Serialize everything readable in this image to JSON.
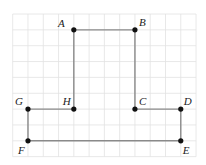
{
  "diagram": {
    "type": "grid-polygon",
    "grid": {
      "columns": 12,
      "rows": 9,
      "origin_px": [
        12.7,
        14
      ],
      "cell_px": [
        15.28,
        15.85
      ],
      "line_color": "#e2e2e2"
    },
    "colors": {
      "segment": "#8a8a8a",
      "point": "#111111",
      "label": "#222222",
      "background": "#ffffff"
    },
    "points": [
      {
        "name": "A",
        "col": 4,
        "row": 1,
        "label_dx": -9,
        "label_dy": -3,
        "anchor": "end"
      },
      {
        "name": "B",
        "col": 8,
        "row": 1,
        "label_dx": 4,
        "label_dy": -4,
        "anchor": "start"
      },
      {
        "name": "C",
        "col": 8,
        "row": 6,
        "label_dx": 4,
        "label_dy": -4,
        "anchor": "start"
      },
      {
        "name": "D",
        "col": 11,
        "row": 6,
        "label_dx": 3,
        "label_dy": -4,
        "anchor": "start"
      },
      {
        "name": "E",
        "col": 11,
        "row": 8,
        "label_dx": 2,
        "label_dy": 13,
        "anchor": "start"
      },
      {
        "name": "F",
        "col": 1,
        "row": 8,
        "label_dx": -10,
        "label_dy": 13,
        "anchor": "start"
      },
      {
        "name": "G",
        "col": 1,
        "row": 6,
        "label_dx": -13,
        "label_dy": -4,
        "anchor": "start"
      },
      {
        "name": "H",
        "col": 4,
        "row": 6,
        "label_dx": -11,
        "label_dy": -4,
        "anchor": "start"
      }
    ],
    "polygon_order": [
      "A",
      "B",
      "C",
      "D",
      "E",
      "F",
      "G",
      "H"
    ]
  }
}
